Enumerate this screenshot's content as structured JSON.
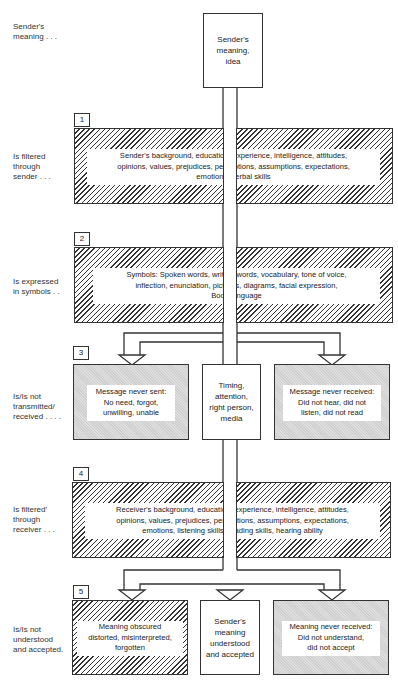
{
  "stage_labels": [
    "Sender's\nmeaning . . .",
    "Is filtered\nthrough\nsender . . .",
    "Is expressed\nin symbols . .",
    "Is/Is not\ntransmitted/\nreceived . . . .",
    "Is filtered'\nthrough\nreceiver . . .",
    "Is/Is not\nunderstood\nand accepted."
  ],
  "top_box": {
    "text": "Sender's\nmeaning,\nidea"
  },
  "stages": {
    "s1": {
      "number": "1",
      "lines": [
        "Sender's  background, education, experience, intelligence, attitudes,",
        "opinions, values, prejudices, perceptions, assumptions, expectations,",
        "emotions, verbal skills"
      ]
    },
    "s2": {
      "number": "2",
      "lines": [
        "Symbols:  Spoken words, written words, vocabulary, tone of voice,",
        "inflection, enunciation, pictures, diagrams, facial expression,",
        "Body language"
      ]
    },
    "s3": {
      "number": "3",
      "left": {
        "lines": [
          "Message never sent:",
          "No need, forgot,",
          "unwilling, unable"
        ]
      },
      "center": {
        "text": "Timing,\nattention,\nright person,\nmedia"
      },
      "right": {
        "lines": [
          "Message never received:",
          "Did not hear, did not",
          "listen, did not read"
        ]
      }
    },
    "s4": {
      "number": "4",
      "lines": [
        "Receiver's background, education, experience, intelligence, attitudes,",
        "opinions, values, prejudices, perceptions, assumptions, expectations,",
        "emotions, listening skills, reading skills, hearing ability"
      ]
    },
    "s5": {
      "number": "5",
      "left": {
        "lines": [
          "Meaning obscured",
          "distorted, misinterpreted,",
          "forgotten"
        ]
      },
      "center": {
        "text": "Sender's\nmeaning\nunderstood\nand accepted"
      },
      "right": {
        "lines": [
          "Meaning never received:",
          "Did not understand,",
          "did not accept"
        ]
      }
    }
  },
  "colors": {
    "line": "#333333",
    "gray_fill": "#d6d6d6"
  }
}
